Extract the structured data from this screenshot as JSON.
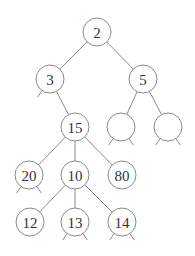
{
  "diagram": {
    "type": "tree",
    "node_radius": 14,
    "colors": {
      "stroke": "#8a8a8a",
      "text": "#333333",
      "fill": "#ffffff"
    },
    "nodes": [
      {
        "id": "n2",
        "label": "2",
        "x": 97,
        "y": 32
      },
      {
        "id": "n3",
        "label": "3",
        "x": 50,
        "y": 79
      },
      {
        "id": "n5",
        "label": "5",
        "x": 143,
        "y": 79
      },
      {
        "id": "n15",
        "label": "15",
        "x": 75,
        "y": 127
      },
      {
        "id": "e1",
        "label": "",
        "x": 121,
        "y": 127
      },
      {
        "id": "e2",
        "label": "",
        "x": 168,
        "y": 127
      },
      {
        "id": "n20",
        "label": "20",
        "x": 29,
        "y": 175
      },
      {
        "id": "n10",
        "label": "10",
        "x": 75,
        "y": 175
      },
      {
        "id": "n80",
        "label": "80",
        "x": 122,
        "y": 175
      },
      {
        "id": "n12",
        "label": "12",
        "x": 30,
        "y": 222
      },
      {
        "id": "n13",
        "label": "13",
        "x": 75,
        "y": 222
      },
      {
        "id": "n14",
        "label": "14",
        "x": 122,
        "y": 222
      }
    ],
    "edges": [
      [
        "n2",
        "n3"
      ],
      [
        "n2",
        "n5"
      ],
      [
        "n3",
        "n15"
      ],
      [
        "n5",
        "e1"
      ],
      [
        "n5",
        "e2"
      ],
      [
        "n15",
        "n20"
      ],
      [
        "n15",
        "n10"
      ],
      [
        "n15",
        "n80"
      ],
      [
        "n10",
        "n12"
      ],
      [
        "n10",
        "n13"
      ],
      [
        "n10",
        "n14"
      ]
    ],
    "stubs": [
      {
        "node": "n3",
        "sides": [
          "left"
        ]
      },
      {
        "node": "e1",
        "sides": [
          "left",
          "right"
        ]
      },
      {
        "node": "e2",
        "sides": [
          "left",
          "right"
        ]
      },
      {
        "node": "n20",
        "sides": [
          "left",
          "right"
        ]
      },
      {
        "node": "n13",
        "sides": [
          "left",
          "right"
        ]
      },
      {
        "node": "n14",
        "sides": [
          "left",
          "right"
        ]
      }
    ]
  }
}
